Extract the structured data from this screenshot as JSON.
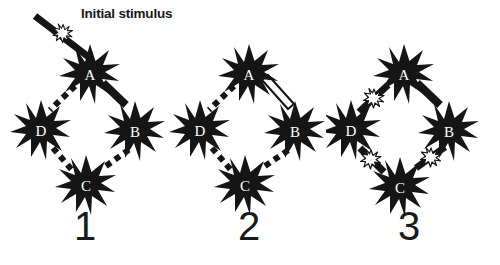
{
  "figure": {
    "background_color": "#ffffff",
    "ink_color": "#151515",
    "panels": [
      {
        "number": "1",
        "nodes": [
          {
            "id": "A",
            "label": "A",
            "position": "top",
            "state": "active"
          },
          {
            "id": "D",
            "label": "D",
            "position": "left",
            "state": "active"
          },
          {
            "id": "B",
            "label": "B",
            "position": "right",
            "state": "active"
          },
          {
            "id": "C",
            "label": "C",
            "position": "bottom",
            "state": "active"
          }
        ],
        "connectors": [
          {
            "from": "A",
            "to": "D",
            "style": "dashed"
          },
          {
            "from": "A",
            "to": "B",
            "style": "solid-filled"
          },
          {
            "from": "D",
            "to": "C",
            "style": "dashed"
          },
          {
            "from": "C",
            "to": "B",
            "style": "dashed"
          }
        ],
        "stimulus": {
          "label": "Initial stimulus",
          "target_node": "A",
          "burst_color": "#ffffff"
        }
      },
      {
        "number": "2",
        "nodes": [
          {
            "id": "A",
            "label": "A",
            "position": "top",
            "state": "active"
          },
          {
            "id": "D",
            "label": "D",
            "position": "left",
            "state": "active"
          },
          {
            "id": "B",
            "label": "B",
            "position": "right",
            "state": "active"
          },
          {
            "id": "C",
            "label": "C",
            "position": "bottom",
            "state": "active"
          }
        ],
        "connectors": [
          {
            "from": "A",
            "to": "D",
            "style": "dashed"
          },
          {
            "from": "A",
            "to": "B",
            "style": "hollow-outlined"
          },
          {
            "from": "D",
            "to": "C",
            "style": "dashed"
          },
          {
            "from": "C",
            "to": "B",
            "style": "dashed"
          }
        ],
        "stimulus": null
      },
      {
        "number": "3",
        "nodes": [
          {
            "id": "A",
            "label": "A",
            "position": "top",
            "state": "active"
          },
          {
            "id": "D",
            "label": "D",
            "position": "left",
            "state": "active"
          },
          {
            "id": "B",
            "label": "B",
            "position": "right",
            "state": "active"
          },
          {
            "id": "C",
            "label": "C",
            "position": "bottom",
            "state": "active"
          }
        ],
        "connectors": [
          {
            "from": "A",
            "to": "D",
            "style": "solid-filled",
            "midpoint_burst": "#ffffff"
          },
          {
            "from": "A",
            "to": "B",
            "style": "solid-filled"
          },
          {
            "from": "D",
            "to": "C",
            "style": "solid-filled",
            "midpoint_burst": "#ffffff"
          },
          {
            "from": "C",
            "to": "B",
            "style": "solid-filled",
            "midpoint_burst": "#ffffff"
          }
        ],
        "stimulus": null
      }
    ]
  }
}
